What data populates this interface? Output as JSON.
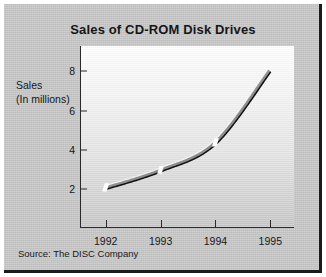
{
  "frame": {
    "plate_color": "#c8c8c8",
    "shadow_color": "#1b1b1b"
  },
  "chart_data": {
    "type": "line",
    "title": "Sales of CD-ROM Disk Drives",
    "xlabel": "",
    "ylabel": "Sales (In millions)",
    "ylabel_lines": [
      "Sales",
      "(In millions)"
    ],
    "categories": [
      "1992",
      "1993",
      "1994",
      "1995"
    ],
    "x": [
      1992,
      1993,
      1994,
      1995
    ],
    "values": [
      2.0,
      2.9,
      4.3,
      8.0
    ],
    "series": [
      {
        "name": "CD-ROM disk drive sales",
        "values": [
          2.0,
          2.9,
          4.3,
          8.0
        ]
      }
    ],
    "xticklabels": [
      "1992",
      "1993",
      "1994",
      "1995"
    ],
    "yticklabels": [
      "2",
      "4",
      "6",
      "8"
    ],
    "yticks": [
      2,
      4,
      6,
      8
    ],
    "ylim": [
      0,
      9.3
    ],
    "xlim": [
      1991.55,
      1995.45
    ],
    "grid": false,
    "legend": false,
    "legend_position": "none",
    "line_style": "3d-ribbon",
    "line_colors": {
      "highlight": "#f2f2f2",
      "body": "#8e8e8e",
      "edge": "#111111"
    },
    "segment_breaks_at": [
      "1992",
      "1993",
      "1994"
    ],
    "annotation": "Source: The DISC Company"
  },
  "source": {
    "text": "Source: The DISC Company"
  }
}
